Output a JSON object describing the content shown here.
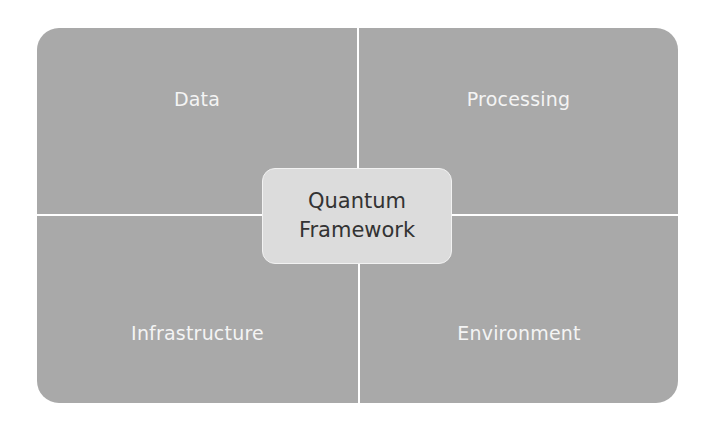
{
  "diagram": {
    "type": "quadrant-with-center",
    "center": {
      "lines": [
        "Quantum",
        "Framework"
      ]
    },
    "quadrants": [
      {
        "position": "top-left",
        "label": "Data"
      },
      {
        "position": "top-right",
        "label": "Processing"
      },
      {
        "position": "bottom-left",
        "label": "Infrastructure"
      },
      {
        "position": "bottom-right",
        "label": "Environment"
      }
    ],
    "colors": {
      "quadrant_fill": "#a9a9a9",
      "quadrant_text": "#f4f4f4",
      "divider": "#ffffff",
      "center_fill": "#dcdcdc",
      "center_text": "#333333",
      "background": "#ffffff"
    }
  }
}
